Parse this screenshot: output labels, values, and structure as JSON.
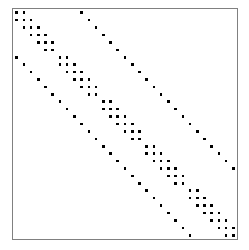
{
  "figure": {
    "width": 249,
    "height": 250,
    "background_color": "#ffffff",
    "title": "",
    "xlabel": "",
    "ylabel": ""
  },
  "plot_frame": {
    "left": 12,
    "top": 8,
    "width": 226,
    "height": 232,
    "border_color": "#808080",
    "border_width": 1,
    "fill_color": "#ffffff"
  },
  "marker": {
    "color": "#000000",
    "size_px": 2.6,
    "shape": "square",
    "name": "nonzero-entry"
  },
  "chart_data": {
    "type": "scatter",
    "title": "",
    "subtitle": "",
    "xlabel": "",
    "ylabel": "",
    "legend": [],
    "grid": false,
    "orientation": "matrix-spy",
    "n_rows": 31,
    "n_cols": 31,
    "xlim": [
      0,
      31
    ],
    "ylim": [
      31,
      0
    ],
    "x_tick_labels": [],
    "y_tick_labels": [],
    "nonzero_count": 172,
    "row_col_pairs": [
      [
        0,
        0
      ],
      [
        0,
        1
      ],
      [
        0,
        9
      ],
      [
        1,
        0
      ],
      [
        1,
        1
      ],
      [
        1,
        2
      ],
      [
        1,
        10
      ],
      [
        2,
        1
      ],
      [
        2,
        2
      ],
      [
        2,
        3
      ],
      [
        2,
        11
      ],
      [
        3,
        2
      ],
      [
        3,
        3
      ],
      [
        3,
        4
      ],
      [
        3,
        12
      ],
      [
        4,
        3
      ],
      [
        4,
        4
      ],
      [
        4,
        5
      ],
      [
        4,
        13
      ],
      [
        5,
        4
      ],
      [
        5,
        5
      ],
      [
        5,
        14
      ],
      [
        6,
        0
      ],
      [
        6,
        6
      ],
      [
        6,
        7
      ],
      [
        6,
        15
      ],
      [
        7,
        1
      ],
      [
        7,
        6
      ],
      [
        7,
        7
      ],
      [
        7,
        8
      ],
      [
        7,
        16
      ],
      [
        8,
        2
      ],
      [
        8,
        7
      ],
      [
        8,
        8
      ],
      [
        8,
        9
      ],
      [
        8,
        17
      ],
      [
        9,
        3
      ],
      [
        9,
        8
      ],
      [
        9,
        9
      ],
      [
        9,
        10
      ],
      [
        9,
        18
      ],
      [
        10,
        4
      ],
      [
        10,
        9
      ],
      [
        10,
        10
      ],
      [
        10,
        11
      ],
      [
        10,
        19
      ],
      [
        11,
        5
      ],
      [
        11,
        10
      ],
      [
        11,
        11
      ],
      [
        11,
        20
      ],
      [
        12,
        6
      ],
      [
        12,
        12
      ],
      [
        12,
        13
      ],
      [
        12,
        21
      ],
      [
        13,
        7
      ],
      [
        13,
        12
      ],
      [
        13,
        13
      ],
      [
        13,
        14
      ],
      [
        13,
        22
      ],
      [
        14,
        8
      ],
      [
        14,
        13
      ],
      [
        14,
        14
      ],
      [
        14,
        15
      ],
      [
        14,
        23
      ],
      [
        15,
        9
      ],
      [
        15,
        14
      ],
      [
        15,
        15
      ],
      [
        15,
        16
      ],
      [
        15,
        24
      ],
      [
        16,
        10
      ],
      [
        16,
        15
      ],
      [
        16,
        16
      ],
      [
        16,
        17
      ],
      [
        16,
        25
      ],
      [
        17,
        11
      ],
      [
        17,
        16
      ],
      [
        17,
        17
      ],
      [
        17,
        26
      ],
      [
        18,
        12
      ],
      [
        18,
        18
      ],
      [
        18,
        19
      ],
      [
        18,
        27
      ],
      [
        19,
        13
      ],
      [
        19,
        18
      ],
      [
        19,
        19
      ],
      [
        19,
        20
      ],
      [
        19,
        28
      ],
      [
        20,
        14
      ],
      [
        20,
        19
      ],
      [
        20,
        20
      ],
      [
        20,
        21
      ],
      [
        20,
        29
      ],
      [
        21,
        15
      ],
      [
        21,
        20
      ],
      [
        21,
        21
      ],
      [
        21,
        22
      ],
      [
        21,
        30
      ],
      [
        22,
        16
      ],
      [
        22,
        21
      ],
      [
        22,
        22
      ],
      [
        22,
        23
      ],
      [
        23,
        17
      ],
      [
        23,
        22
      ],
      [
        23,
        23
      ],
      [
        24,
        18
      ],
      [
        24,
        24
      ],
      [
        24,
        25
      ],
      [
        25,
        19
      ],
      [
        25,
        24
      ],
      [
        25,
        25
      ],
      [
        25,
        26
      ],
      [
        26,
        20
      ],
      [
        26,
        25
      ],
      [
        26,
        26
      ],
      [
        26,
        27
      ],
      [
        27,
        21
      ],
      [
        27,
        26
      ],
      [
        27,
        27
      ],
      [
        27,
        28
      ],
      [
        28,
        22
      ],
      [
        28,
        27
      ],
      [
        28,
        28
      ],
      [
        28,
        29
      ],
      [
        29,
        23
      ],
      [
        29,
        28
      ],
      [
        29,
        29
      ],
      [
        29,
        30
      ],
      [
        30,
        24
      ],
      [
        30,
        29
      ],
      [
        30,
        30
      ]
    ]
  }
}
